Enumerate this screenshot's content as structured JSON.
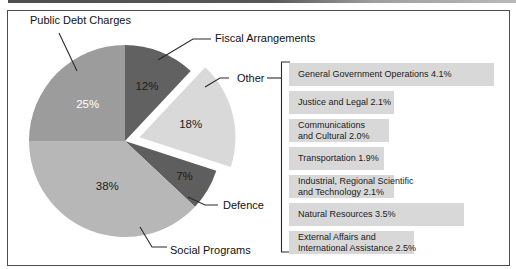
{
  "chart_data": {
    "type": "pie",
    "legend_position": "none",
    "slices": [
      {
        "label": "Fiscal Arrangements",
        "value": 12,
        "pct_label": "12%",
        "color": "#616161",
        "exploded": false,
        "label_color": "#1c1c1c",
        "label_r": 0.62
      },
      {
        "label": "Other",
        "value": 18,
        "pct_label": "18%",
        "color": "#d9d9d9",
        "exploded": true,
        "label_color": "#1c1c1c",
        "label_r": 0.55
      },
      {
        "label": "Defence",
        "value": 7,
        "pct_label": "7%",
        "color": "#5e5e5e",
        "exploded": false,
        "label_color": "#1c1c1c",
        "label_r": 0.72
      },
      {
        "label": "Social Programs",
        "value": 38,
        "pct_label": "38%",
        "color": "#b7b7b7",
        "exploded": false,
        "label_color": "#1c1c1c",
        "label_r": 0.5
      },
      {
        "label": "Public Debt Charges",
        "value": 25,
        "pct_label": "25%",
        "color": "#9c9c9c",
        "exploded": false,
        "label_color": "#ffffff",
        "label_r": 0.55
      }
    ],
    "other_breakdown": [
      {
        "lines": [
          "General Government Operations 4.1%"
        ],
        "value": 4.1
      },
      {
        "lines": [
          "Justice and Legal 2.1%"
        ],
        "value": 2.1
      },
      {
        "lines": [
          "Communications",
          "and Cultural 2.0%"
        ],
        "value": 2.0
      },
      {
        "lines": [
          "Transportation 1.9%"
        ],
        "value": 1.9
      },
      {
        "lines": [
          "Industrial, Regional Scientific",
          "and Technology 2.1%"
        ],
        "value": 2.1
      },
      {
        "lines": [
          "Natural Resources 3.5%"
        ],
        "value": 3.5
      },
      {
        "lines": [
          "External Affairs and",
          "International Assistance 2.5%"
        ],
        "value": 2.5
      }
    ],
    "colors": {
      "bar_background": "#d8d8d8",
      "line": "#2a2a2a",
      "text": "#111111"
    }
  }
}
